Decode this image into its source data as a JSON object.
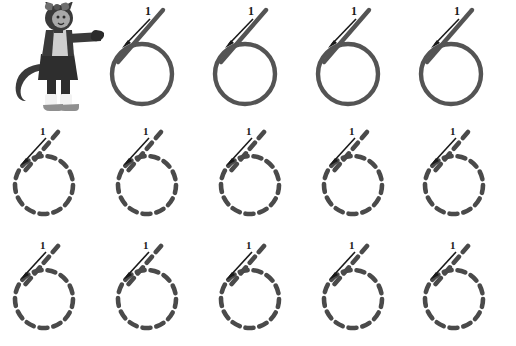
{
  "worksheet": {
    "title": "Number 6 Handwriting Tracing Practice",
    "digit": "6",
    "stroke_label": "1",
    "stroke_count": 1,
    "background_color": "#ffffff",
    "stroke_color": "#545454",
    "dash_color": "#4a4a4a",
    "arrow_color": "#1a1a1a",
    "label_color": "#1a1a1a",
    "canvas": {
      "width": 516,
      "height": 346
    }
  },
  "mascot": {
    "name": "cat-character",
    "description": "Cartoon cat girl pointing at the number six",
    "colors": {
      "fur": "#3a3a3a",
      "shirt": "#cfcfcf",
      "skirt": "#2e2e2e",
      "socks": "#f2f2f2",
      "shoes": "#8f8f8f",
      "face": "#a8a8a8",
      "bow": "#6e6e6e"
    }
  },
  "rows": [
    {
      "id": "row-1",
      "kind": "example",
      "label": "Solid example row",
      "has_mascot": true,
      "items": [
        {
          "id": "r1c1",
          "style": "solid",
          "left": 104,
          "stroke_label": "1"
        },
        {
          "id": "r1c2",
          "style": "solid",
          "left": 207,
          "stroke_label": "1"
        },
        {
          "id": "r1c3",
          "style": "solid",
          "left": 310,
          "stroke_label": "1"
        },
        {
          "id": "r1c4",
          "style": "solid",
          "left": 413,
          "stroke_label": "1"
        }
      ]
    },
    {
      "id": "row-2",
      "kind": "trace",
      "label": "Dashed tracing row one",
      "has_mascot": false,
      "items": [
        {
          "id": "r2c1",
          "style": "dashed",
          "left": 2,
          "stroke_label": "1"
        },
        {
          "id": "r2c2",
          "style": "dashed",
          "left": 105,
          "stroke_label": "1"
        },
        {
          "id": "r2c3",
          "style": "dashed",
          "left": 208,
          "stroke_label": "1"
        },
        {
          "id": "r2c4",
          "style": "dashed",
          "left": 311,
          "stroke_label": "1"
        },
        {
          "id": "r2c5",
          "style": "dashed",
          "left": 412,
          "stroke_label": "1"
        }
      ]
    },
    {
      "id": "row-3",
      "kind": "trace",
      "label": "Dashed tracing row two",
      "has_mascot": false,
      "items": [
        {
          "id": "r3c1",
          "style": "dashed",
          "left": 2,
          "stroke_label": "1"
        },
        {
          "id": "r3c2",
          "style": "dashed",
          "left": 105,
          "stroke_label": "1"
        },
        {
          "id": "r3c3",
          "style": "dashed",
          "left": 208,
          "stroke_label": "1"
        },
        {
          "id": "r3c4",
          "style": "dashed",
          "left": 311,
          "stroke_label": "1"
        },
        {
          "id": "r3c5",
          "style": "dashed",
          "left": 412,
          "stroke_label": "1"
        }
      ]
    }
  ]
}
